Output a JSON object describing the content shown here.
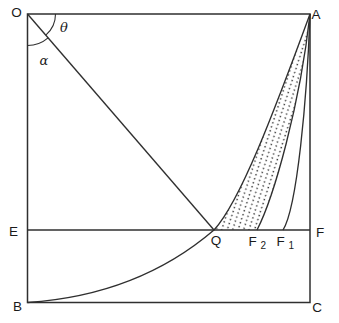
{
  "figure": {
    "background_color": "#ffffff",
    "stroke_color": "#2f2f2f",
    "label_color": "#1a1a1a",
    "vertices": {
      "top_left": "O",
      "top_right": "A",
      "bottom_left": "B",
      "bottom_right": "C"
    },
    "horizontal_line": {
      "left_label": "E",
      "right_label": "F"
    },
    "points_on_line": {
      "q": "Q",
      "f2": {
        "base": "F",
        "subscript": "2"
      },
      "f1": {
        "base": "F",
        "subscript": "1"
      }
    },
    "angles": {
      "theta": "θ",
      "alpha": "α"
    }
  }
}
